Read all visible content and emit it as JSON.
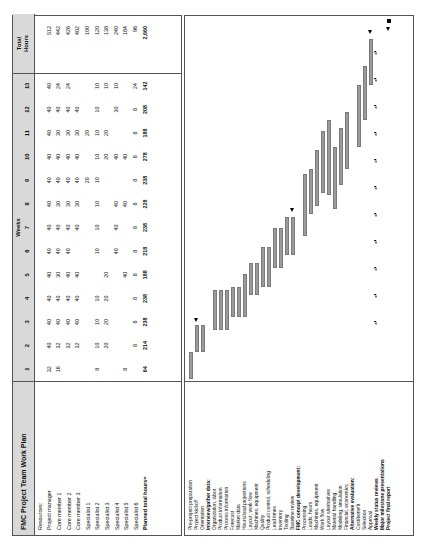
{
  "title": "FMC Project Team Work Plan",
  "header": {
    "weeks_label": "Weeks",
    "total_hours_label_line1": "Total",
    "total_hours_label_line2": "Hours",
    "weeks": [
      "1",
      "2",
      "3",
      "4",
      "5",
      "6",
      "7",
      "8",
      "9",
      "10",
      "11",
      "12",
      "13"
    ]
  },
  "resources_heading": "Resources:",
  "planned_total_label": "Planned total hours=",
  "chart_data": {
    "type": "table",
    "title": "FMC Project Team Work Plan",
    "xlabel": "Weeks",
    "ylabel": "Hours",
    "categories": [
      "1",
      "2",
      "3",
      "4",
      "5",
      "6",
      "7",
      "8",
      "9",
      "10",
      "11",
      "12",
      "13"
    ],
    "series": [
      {
        "name": "Project manager",
        "values": [
          32,
          40,
          40,
          40,
          40,
          40,
          40,
          40,
          40,
          40,
          40,
          40,
          40
        ],
        "total": 512
      },
      {
        "name": "Core member 1",
        "values": [
          16,
          32,
          40,
          40,
          40,
          40,
          40,
          30,
          40,
          40,
          30,
          40,
          24
        ],
        "total": 442
      },
      {
        "name": "Core member 2",
        "values": [
          "",
          32,
          40,
          40,
          30,
          40,
          40,
          30,
          40,
          40,
          30,
          40,
          24
        ],
        "total": 426
      },
      {
        "name": "Core member 3",
        "values": [
          "",
          32,
          40,
          40,
          40,
          40,
          40,
          30,
          40,
          40,
          30,
          40,
          ""
        ],
        "total": 402
      },
      {
        "name": "Specialist 1",
        "values": [
          "",
          "",
          10,
          20,
          20,
          "",
          20,
          "",
          20,
          "",
          20,
          "",
          ""
        ],
        "total": 100
      },
      {
        "name": "Specialist 2",
        "values": [
          8,
          10,
          10,
          20,
          10,
          10,
          10,
          10,
          10,
          10,
          10,
          10,
          10
        ],
        "total": 120
      },
      {
        "name": "Specialist 3",
        "values": [
          "",
          20,
          20,
          "",
          "",
          "",
          "",
          "",
          "",
          20,
          20,
          "",
          10
        ],
        "total": 138
      },
      {
        "name": "Specialist 4",
        "values": [
          "",
          20,
          20,
          20,
          40,
          40,
          40,
          40,
          "",
          40,
          "",
          30,
          10
        ],
        "total": 240
      },
      {
        "name": "Specialist 5",
        "values": [
          "",
          40,
          40,
          "",
          "",
          "",
          8,
          40,
          8,
          40,
          "",
          "",
          24
        ],
        "total": 184
      },
      {
        "name": "Specialist 6",
        "values": [
          8,
          8,
          8,
          8,
          8,
          8,
          8,
          8,
          8,
          8,
          8,
          8,
          ""
        ],
        "total": 96
      },
      {
        "name": "Planned total hours=",
        "values": [
          64,
          214,
          238,
          238,
          188,
          218,
          238,
          228,
          238,
          278,
          188,
          208,
          142
        ],
        "total": "2,660"
      }
    ],
    "totals_column": [
      "512",
      "442",
      "426",
      "402",
      "100",
      "120",
      "138",
      "240",
      "184",
      "96",
      "2,660"
    ]
  },
  "resources": [
    {
      "label": "Resources:",
      "bold": false,
      "is_heading": true,
      "weeks": [
        "",
        "",
        "",
        "",
        "",
        "",
        "",
        "",
        "",
        "",
        "",
        "",
        ""
      ],
      "total": ""
    },
    {
      "label": "Project manager",
      "bold": false,
      "weeks": [
        "32",
        "40",
        "40",
        "40",
        "40",
        "40",
        "40",
        "40",
        "40",
        "40",
        "40",
        "40",
        "40"
      ],
      "total": "512"
    },
    {
      "label": "Core member 1",
      "bold": false,
      "weeks": [
        "16",
        "32",
        "40",
        "40",
        "30",
        "40",
        "40",
        "30",
        "40",
        "40",
        "30",
        "40",
        "24"
      ],
      "total": "442"
    },
    {
      "label": "Core member 2",
      "bold": false,
      "weeks": [
        "",
        "32",
        "40",
        "40",
        "40",
        "40",
        "40",
        "30",
        "40",
        "40",
        "30",
        "40",
        "24"
      ],
      "total": "426"
    },
    {
      "label": "Core member 3",
      "bold": false,
      "weeks": [
        "",
        "32",
        "40",
        "40",
        "40",
        "",
        "40",
        "30",
        "40",
        "40",
        "30",
        "40",
        ""
      ],
      "total": "402"
    },
    {
      "label": "Specialist 1",
      "bold": false,
      "weeks": [
        "",
        "",
        "",
        "",
        "",
        "",
        "",
        "",
        "20",
        "",
        "20",
        "",
        ""
      ],
      "total": "100"
    },
    {
      "label": "Specialist 2",
      "bold": false,
      "weeks": [
        "8",
        "10",
        "10",
        "10",
        "",
        "10",
        "10",
        "10",
        "10",
        "10",
        "10",
        "10",
        "10"
      ],
      "total": "120"
    },
    {
      "label": "Specialist 3",
      "bold": false,
      "weeks": [
        "",
        "20",
        "20",
        "20",
        "20",
        "",
        "",
        "",
        "",
        "20",
        "20",
        "",
        "10"
      ],
      "total": "138"
    },
    {
      "label": "Specialist 4",
      "bold": false,
      "weeks": [
        "",
        "",
        "",
        "",
        "",
        "40",
        "40",
        "40",
        "",
        "40",
        "",
        "30",
        "10"
      ],
      "total": "240"
    },
    {
      "label": "Specialist 5",
      "bold": false,
      "weeks": [
        "8",
        "",
        "",
        "",
        "40",
        "",
        "",
        "40",
        "",
        "40",
        "",
        "",
        ""
      ],
      "total": "184"
    },
    {
      "label": "Specialist 6",
      "bold": false,
      "weeks": [
        "",
        "8",
        "8",
        "8",
        "8",
        "8",
        "8",
        "8",
        "8",
        "8",
        "8",
        "8",
        "24"
      ],
      "total": "96"
    },
    {
      "label": "Planned total hours=",
      "bold": true,
      "weeks": [
        "64",
        "214",
        "238",
        "238",
        "188",
        "218",
        "238",
        "228",
        "238",
        "278",
        "188",
        "208",
        "142"
      ],
      "total": "2,660"
    }
  ],
  "tasks": [
    {
      "label": "Pre-project preparation",
      "bold": false,
      "bar": {
        "start": 0.0,
        "end": 1.0
      },
      "markers": []
    },
    {
      "label": "Project kickoff",
      "bold": false,
      "bar": {
        "start": 1.0,
        "end": 2.0
      },
      "markers": [
        {
          "type": "triangle-solid",
          "at": 2.1
        }
      ]
    },
    {
      "label": "Orientation",
      "bold": false,
      "bar": {
        "start": 1.0,
        "end": 2.0
      },
      "markers": []
    },
    {
      "label": "Interview/gather data:",
      "bold": true,
      "bar": null,
      "markers": []
    },
    {
      "label": "Organization, labor",
      "bold": false,
      "bar": {
        "start": 1.8,
        "end": 3.3
      },
      "markers": []
    },
    {
      "label": "Product information",
      "bold": false,
      "bar": {
        "start": 1.8,
        "end": 3.3
      },
      "markers": []
    },
    {
      "label": "Process information",
      "bold": false,
      "bar": {
        "start": 1.8,
        "end": 3.3
      },
      "markers": []
    },
    {
      "label": "Forecast",
      "bold": false,
      "bar": {
        "start": 2.3,
        "end": 3.4
      },
      "markers": []
    },
    {
      "label": "Market data",
      "bold": false,
      "bar": {
        "start": 2.3,
        "end": 3.4
      },
      "markers": []
    },
    {
      "label": "Hours/load projections",
      "bold": false,
      "bar": {
        "start": 2.3,
        "end": 3.9
      },
      "markers": []
    },
    {
      "label": "Layout, work flow",
      "bold": false,
      "bar": {
        "start": 3.1,
        "end": 4.3
      },
      "markers": []
    },
    {
      "label": "Machines, equipment",
      "bold": false,
      "bar": {
        "start": 3.1,
        "end": 4.3
      },
      "markers": []
    },
    {
      "label": "Quality",
      "bold": false,
      "bar": {
        "start": 3.4,
        "end": 4.9
      },
      "markers": []
    },
    {
      "label": "Product control, scheduling",
      "bold": false,
      "bar": {
        "start": 3.4,
        "end": 4.9
      },
      "markers": []
    },
    {
      "label": "Lead times",
      "bold": false,
      "bar": {
        "start": 4.1,
        "end": 5.6
      },
      "markers": []
    },
    {
      "label": "Inventory",
      "bold": false,
      "bar": {
        "start": 4.1,
        "end": 5.6
      },
      "markers": []
    },
    {
      "label": "Tooling",
      "bold": false,
      "bar": {
        "start": 4.6,
        "end": 6.0
      },
      "markers": []
    },
    {
      "label": "Baseline review",
      "bold": false,
      "bar": {
        "start": 4.6,
        "end": 6.0
      },
      "markers": [
        {
          "type": "triangle-solid",
          "at": 6.2
        }
      ]
    },
    {
      "label": "FMC concept development:",
      "bold": true,
      "bar": null,
      "markers": []
    },
    {
      "label": "Processing",
      "bold": false,
      "bar": {
        "start": 5.3,
        "end": 7.6
      },
      "markers": []
    },
    {
      "label": "Loads, hours",
      "bold": false,
      "bar": {
        "start": 6.1,
        "end": 7.8
      },
      "markers": []
    },
    {
      "label": "Machines, equipment",
      "bold": false,
      "bar": {
        "start": 6.4,
        "end": 8.5
      },
      "markers": []
    },
    {
      "label": "Work flow",
      "bold": false,
      "bar": {
        "start": 6.9,
        "end": 9.2
      },
      "markers": []
    },
    {
      "label": "Layout alternatives",
      "bold": false,
      "bar": {
        "start": 6.8,
        "end": 9.6
      },
      "markers": []
    },
    {
      "label": "Material handling",
      "bold": false,
      "bar": {
        "start": 6.3,
        "end": 8.6
      },
      "markers": []
    },
    {
      "label": "Modeling, simulation",
      "bold": false,
      "bar": {
        "start": 7.2,
        "end": 9.3
      },
      "markers": []
    },
    {
      "label": "Financial, economics",
      "bold": false,
      "bar": {
        "start": 7.8,
        "end": 9.9
      },
      "markers": []
    },
    {
      "label": "Alternative evaluation:",
      "bold": true,
      "bar": null,
      "markers": []
    },
    {
      "label": "Cost/benefit",
      "bold": false,
      "bar": {
        "start": 8.6,
        "end": 10.9
      },
      "markers": []
    },
    {
      "label": "Selection",
      "bold": false,
      "bar": {
        "start": 9.6,
        "end": 11.6
      },
      "markers": []
    },
    {
      "label": "Approval",
      "bold": false,
      "bar": {
        "start": 10.9,
        "end": 12.6
      },
      "markers": [
        {
          "type": "triangle-solid",
          "at": 12.8
        }
      ]
    },
    {
      "label": "Weekly status reviews",
      "bold": true,
      "bar": null,
      "markers": [
        {
          "type": "triangle-open",
          "at": 2.0
        },
        {
          "type": "triangle-open",
          "at": 3.0
        },
        {
          "type": "triangle-open",
          "at": 4.0
        },
        {
          "type": "triangle-open",
          "at": 5.0
        },
        {
          "type": "triangle-open",
          "at": 6.0
        },
        {
          "type": "triangle-open",
          "at": 7.0
        },
        {
          "type": "triangle-open",
          "at": 8.0
        },
        {
          "type": "triangle-open",
          "at": 9.0
        },
        {
          "type": "triangle-open",
          "at": 10.0
        },
        {
          "type": "triangle-open",
          "at": 11.0
        },
        {
          "type": "triangle-open",
          "at": 12.0
        }
      ]
    },
    {
      "label": "Major milestone presentations",
      "bold": true,
      "bar": null,
      "markers": []
    },
    {
      "label": "Project final report",
      "bold": true,
      "bar": null,
      "markers": [
        {
          "type": "triangle-solid",
          "at": 12.9
        },
        {
          "type": "square-solid",
          "at": 13.2
        }
      ]
    }
  ],
  "colors": {
    "bar_fill": "#9b9b9b",
    "bar_border": "#7a7a7a",
    "header_band": "#d9d9d9",
    "grid_line": "#555555",
    "marker": "#000000"
  }
}
